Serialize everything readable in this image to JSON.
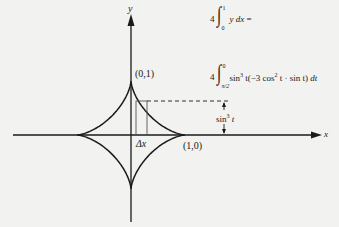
{
  "axes": {
    "x_label": "x",
    "y_label": "y"
  },
  "points": {
    "top_cusp": "(0,1)",
    "right_cusp": "(1,0)"
  },
  "annotations": {
    "delta_x": "Δx",
    "height_label_base": "sin",
    "height_label_exp": "3",
    "height_label_var": "t"
  },
  "formulas": [
    {
      "coefficient": "4",
      "upper_limit": "1",
      "lower_limit": "0",
      "integrand": "y dx =",
      "integrand_parts": [
        "y",
        "dx",
        "="
      ]
    },
    {
      "coefficient": "4",
      "upper_limit": "0",
      "lower_limit": "π/2",
      "integrand": "sin³ t(−3 cos² t · sin t) dt",
      "integrand_parts": {
        "a": "sin",
        "a_exp": "3",
        "b": "t(−3 cos",
        "b_exp": "2",
        "c": "t · sin t)",
        "d": "dt"
      }
    }
  ],
  "colors": {
    "background": "#f2f2f0",
    "ink": "#1a1a1a",
    "rect": "#555555"
  }
}
